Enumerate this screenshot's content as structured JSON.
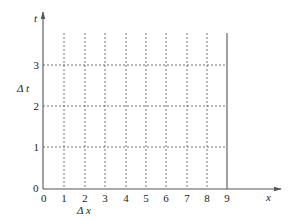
{
  "diagram": {
    "type": "grid-axes",
    "axes": {
      "x_label": "x",
      "y_label": "t",
      "origin_label_x": "0",
      "origin_label_y": "0"
    },
    "x_ticks": [
      "1",
      "2",
      "3",
      "4",
      "5",
      "6",
      "7",
      "8",
      "9"
    ],
    "y_ticks": [
      "1",
      "2",
      "3"
    ],
    "annotations": {
      "delta_x": "Δ x",
      "delta_t": "Δ t"
    },
    "grid": {
      "vertical_dashed_at": [
        1,
        2,
        3,
        4,
        5,
        6,
        7,
        8
      ],
      "vertical_solid_at": 9,
      "horizontal_dashed_at": [
        1,
        2,
        3
      ]
    },
    "colors": {
      "axis": "#555555",
      "grid": "#666666",
      "text": "#222222"
    }
  }
}
